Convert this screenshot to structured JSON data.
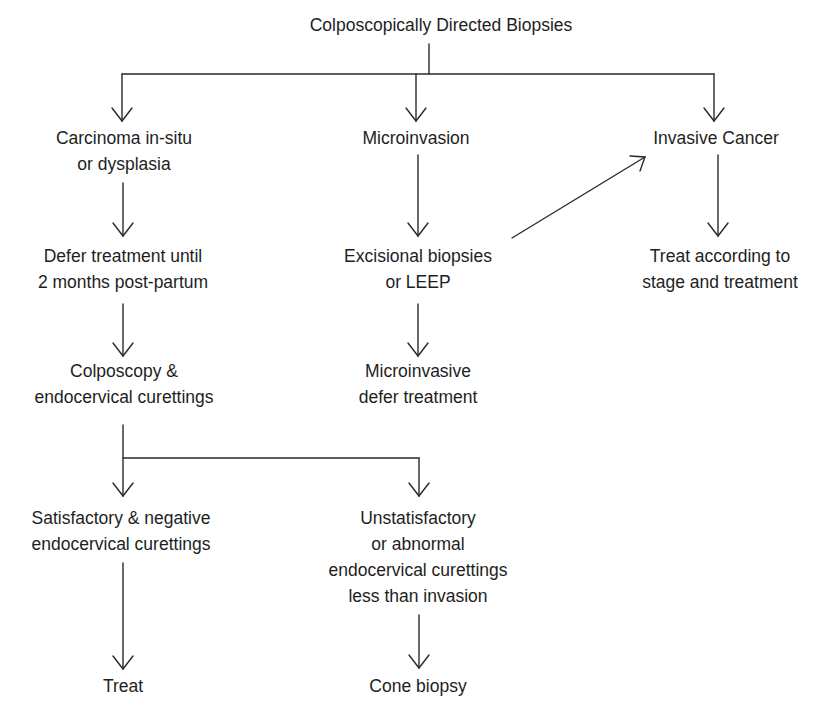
{
  "diagram": {
    "type": "flowchart",
    "line_color": "#2a2a2a",
    "text_color": "#1e1e1e",
    "background": "#ffffff",
    "root": {
      "id": "root",
      "lines": [
        "Colposcopically Directed Biopsies"
      ]
    },
    "nodes": {
      "cis": {
        "lines": [
          "Carcinoma in-situ",
          "or dysplasia"
        ]
      },
      "micro": {
        "lines": [
          "Microinvasion"
        ]
      },
      "invasive": {
        "lines": [
          "Invasive Cancer"
        ]
      },
      "defer": {
        "lines": [
          "Defer treatment until",
          "2 months post-partum"
        ]
      },
      "excisional": {
        "lines": [
          "Excisional biopsies",
          "or LEEP"
        ]
      },
      "treat_stage": {
        "lines": [
          "Treat according to",
          "stage and treatment"
        ]
      },
      "colposcopy": {
        "lines": [
          "Colposcopy &",
          "endocervical curettings"
        ]
      },
      "micro_defer": {
        "lines": [
          "Microinvasive",
          "defer treatment"
        ]
      },
      "satisfactory": {
        "lines": [
          "Satisfactory & negative",
          "endocervical curettings"
        ]
      },
      "unsatisfactory": {
        "lines": [
          "Unstatisfactory",
          "or abnormal",
          "endocervical curettings",
          "less than invasion"
        ]
      },
      "treat": {
        "lines": [
          "Treat"
        ]
      },
      "cone": {
        "lines": [
          "Cone biopsy"
        ]
      }
    },
    "edges": [
      {
        "from": "root",
        "to": "cis"
      },
      {
        "from": "root",
        "to": "micro"
      },
      {
        "from": "root",
        "to": "invasive"
      },
      {
        "from": "cis",
        "to": "defer"
      },
      {
        "from": "micro",
        "to": "excisional"
      },
      {
        "from": "excisional",
        "to": "invasive"
      },
      {
        "from": "invasive",
        "to": "treat_stage"
      },
      {
        "from": "defer",
        "to": "colposcopy"
      },
      {
        "from": "excisional",
        "to": "micro_defer"
      },
      {
        "from": "colposcopy",
        "to": "satisfactory"
      },
      {
        "from": "colposcopy",
        "to": "unsatisfactory"
      },
      {
        "from": "satisfactory",
        "to": "treat"
      },
      {
        "from": "unsatisfactory",
        "to": "cone"
      }
    ]
  }
}
